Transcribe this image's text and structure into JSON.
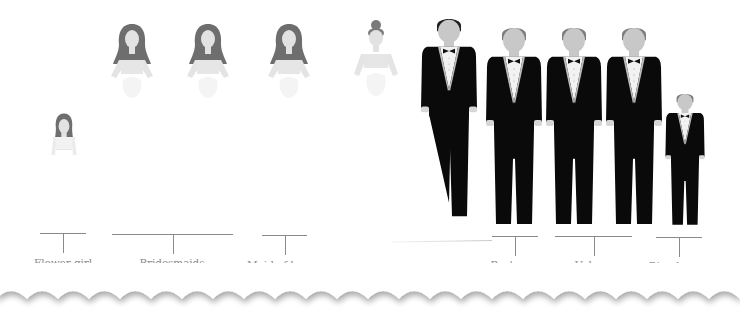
{
  "colors": {
    "background": "#ffffff",
    "tux": "#0a0a0a",
    "skin_groom_side": "#c8c8c8",
    "hair_groom_side": "#7c7c7c",
    "hair_bride_side": "#6e6e6e",
    "dress": "#e4e4e4",
    "label_text": "#8c8c8c",
    "bracket_line": "#8a8a8a"
  },
  "bride_side": [
    {
      "role": "flower-girl",
      "count": 1
    },
    {
      "role": "bridesmaid",
      "count": 3
    },
    {
      "role": "maid-of-honor",
      "count": 1
    }
  ],
  "groom_side": [
    {
      "role": "best-man",
      "count": 1
    },
    {
      "role": "usher",
      "count": 3
    },
    {
      "role": "ring-bearer",
      "count": 1
    }
  ],
  "labels": {
    "flower_girl": "Flower girl",
    "bridesmaids": "Bridesmaids",
    "maid_of_honor": "Maid of honor",
    "best_man": "Best man",
    "ushers": "Ushers",
    "ring_bearer": "Ring bearer"
  }
}
